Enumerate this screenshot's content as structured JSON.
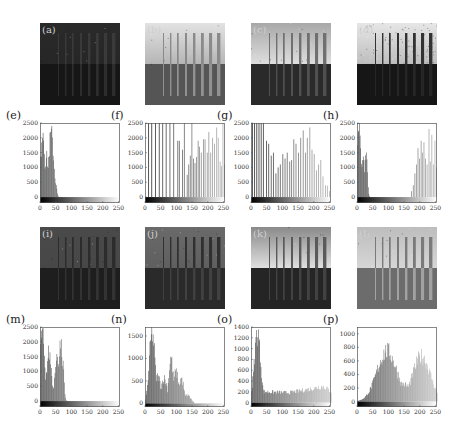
{
  "figure": {
    "images": [
      {
        "label": "(a)",
        "x": 40,
        "y": 23,
        "top": "#2a2a2a",
        "topEnd": "#262626",
        "bottom": "#161616",
        "bars": [
          "#3a3a3a",
          "#333"
        ],
        "noise": 0.02
      },
      {
        "label": "(b)",
        "x": 145,
        "y": 23,
        "top": "#e2e2e2",
        "topEnd": "#b5b5b5",
        "bottom": "#555555",
        "bars": [
          "#8a8a8a",
          "#a0a0a0"
        ],
        "noise": 0.03
      },
      {
        "label": "(c)",
        "x": 251,
        "y": 23,
        "top": "#a8a8a8",
        "topEnd": "#dedede",
        "bottom": "#2a2a2a",
        "bars": [
          "#707070",
          "#5a5a5a"
        ],
        "noise": 0.03
      },
      {
        "label": "(d)",
        "x": 357,
        "y": 23,
        "top": "#e6e6e6",
        "topEnd": "#bdbdbd",
        "bottom": "#161616",
        "bars": [
          "#333",
          "#2a2a2a"
        ],
        "noise": 0.25
      },
      {
        "label": "(i)",
        "x": 40,
        "y": 227,
        "top": "#4a4a4a",
        "topEnd": "#474747",
        "bottom": "#1e1e1e",
        "bars": [
          "#2c2c2c",
          "#383838"
        ],
        "noise": 0.03
      },
      {
        "label": "(j)",
        "x": 145,
        "y": 227,
        "top": "#6a6a6a",
        "topEnd": "#5f5f5f",
        "bottom": "#2a2a2a",
        "bars": [
          "#303030",
          "#474747"
        ],
        "noise": 0.03
      },
      {
        "label": "(k)",
        "x": 251,
        "y": 227,
        "top": "#8a8a8a",
        "topEnd": "#e0e0e0",
        "bottom": "#252525",
        "bars": [
          "#5a5a5a",
          "#4a4a4a"
        ],
        "noise": 0.03
      },
      {
        "label": "(l)",
        "x": 357,
        "y": 227,
        "top": "#bdbdbd",
        "topEnd": "#d6d6d6",
        "bottom": "#6c6c6c",
        "bars": [
          "#7a7a7a",
          "#b0b0b0"
        ],
        "noise": 0.03
      }
    ]
  },
  "chart_data": [
    {
      "panel": "(e)",
      "type": "bar",
      "title": "",
      "xlabel": "",
      "ylabel": "",
      "xlim": [
        0,
        255
      ],
      "ylim": [
        -200,
        2500
      ],
      "xticks": [
        0,
        50,
        100,
        150,
        200,
        250
      ],
      "yticks": [
        0,
        500,
        1000,
        1500,
        2000,
        2500
      ],
      "peaks": [
        {
          "x": 8,
          "h": 2500,
          "w": 6
        },
        {
          "x": 20,
          "h": 1450,
          "w": 6
        },
        {
          "x": 35,
          "h": 2300,
          "w": 8
        },
        {
          "x": 48,
          "h": 600,
          "w": 4
        }
      ],
      "cutoff": 58,
      "style": "dense",
      "color": "#3a3a3a"
    },
    {
      "panel": "(f)",
      "type": "bar",
      "title": "",
      "xlim": [
        0,
        255
      ],
      "ylim": [
        -200,
        2500
      ],
      "xticks": [
        0,
        50,
        100,
        150,
        200,
        250
      ],
      "yticks": [
        0,
        500,
        1000,
        1500,
        2000,
        2500
      ],
      "spikes": [
        [
          10,
          2500
        ],
        [
          20,
          2500
        ],
        [
          32,
          2500
        ],
        [
          44,
          2500
        ],
        [
          55,
          2500
        ],
        [
          66,
          2500
        ],
        [
          78,
          2500
        ],
        [
          90,
          2500
        ],
        [
          103,
          1900
        ],
        [
          108,
          1900
        ],
        [
          118,
          1600
        ],
        [
          124,
          2500
        ],
        [
          133,
          750
        ],
        [
          138,
          1100
        ],
        [
          143,
          1400
        ],
        [
          148,
          2500
        ],
        [
          153,
          1300
        ],
        [
          158,
          1150
        ],
        [
          163,
          1350
        ],
        [
          168,
          1900
        ],
        [
          172,
          1700
        ],
        [
          178,
          1500
        ],
        [
          185,
          1950
        ],
        [
          190,
          1950
        ],
        [
          197,
          1500
        ],
        [
          202,
          2200
        ],
        [
          208,
          1500
        ],
        [
          214,
          2000
        ],
        [
          220,
          1800
        ],
        [
          227,
          2350
        ],
        [
          232,
          2000
        ],
        [
          238,
          1200
        ],
        [
          242,
          1050
        ],
        [
          247,
          2500
        ],
        [
          252,
          1100
        ]
      ],
      "style": "sparse",
      "color": "#8a8a8a"
    },
    {
      "panel": "(g)",
      "type": "bar",
      "title": "",
      "xlim": [
        0,
        255
      ],
      "ylim": [
        -200,
        2500
      ],
      "xticks": [
        0,
        50,
        100,
        150,
        200,
        250
      ],
      "yticks": [
        0,
        500,
        1000,
        1500,
        2000,
        2500
      ],
      "spikes": [
        [
          3,
          2500
        ],
        [
          10,
          2500
        ],
        [
          17,
          2500
        ],
        [
          24,
          2500
        ],
        [
          31,
          2500
        ],
        [
          38,
          2500
        ],
        [
          48,
          1900
        ],
        [
          55,
          1800
        ],
        [
          63,
          1400
        ],
        [
          70,
          1500
        ],
        [
          78,
          800
        ],
        [
          85,
          1000
        ],
        [
          92,
          1100
        ],
        [
          100,
          1450
        ],
        [
          107,
          1300
        ],
        [
          114,
          1500
        ],
        [
          122,
          1200
        ],
        [
          128,
          1250
        ],
        [
          135,
          1950
        ],
        [
          142,
          1800
        ],
        [
          150,
          1500
        ],
        [
          157,
          2000
        ],
        [
          165,
          2250
        ],
        [
          172,
          1500
        ],
        [
          178,
          2000
        ],
        [
          186,
          2350
        ],
        [
          193,
          1600
        ],
        [
          200,
          1450
        ],
        [
          207,
          900
        ],
        [
          214,
          1100
        ],
        [
          221,
          1250
        ],
        [
          228,
          700
        ],
        [
          236,
          400
        ],
        [
          242,
          380
        ],
        [
          249,
          200
        ]
      ],
      "style": "sparse",
      "color": "#999999"
    },
    {
      "panel": "(h)",
      "type": "bar",
      "title": "",
      "xlim": [
        0,
        255
      ],
      "ylim": [
        -200,
        2500
      ],
      "xticks": [
        0,
        50,
        100,
        150,
        200,
        250
      ],
      "yticks": [
        0,
        500,
        1000,
        1500,
        2000,
        2500
      ],
      "peaks": [
        {
          "x": 5,
          "h": 2500,
          "w": 6
        },
        {
          "x": 18,
          "h": 1500,
          "w": 6
        },
        {
          "x": 28,
          "h": 1750,
          "w": 4
        }
      ],
      "cutoff": 40,
      "spikes": [
        [
          172,
          200
        ],
        [
          178,
          400
        ],
        [
          183,
          800
        ],
        [
          188,
          1100
        ],
        [
          193,
          1650
        ],
        [
          198,
          1300
        ],
        [
          203,
          1900
        ],
        [
          207,
          1500
        ],
        [
          212,
          1850
        ],
        [
          217,
          1300
        ],
        [
          222,
          1100
        ],
        [
          228,
          2300
        ],
        [
          232,
          1200
        ],
        [
          237,
          2100
        ],
        [
          242,
          1100
        ],
        [
          247,
          1900
        ],
        [
          252,
          1000
        ]
      ],
      "style": "dense",
      "color": "#333333"
    },
    {
      "panel": "(m)",
      "type": "bar",
      "title": "",
      "xlim": [
        0,
        255
      ],
      "ylim": [
        -200,
        2500
      ],
      "xticks": [
        0,
        50,
        100,
        150,
        200,
        250
      ],
      "yticks": [
        0,
        500,
        1000,
        1500,
        2000,
        2500
      ],
      "peaks": [
        {
          "x": 6,
          "h": 2500,
          "w": 7
        },
        {
          "x": 28,
          "h": 1750,
          "w": 8
        },
        {
          "x": 52,
          "h": 1700,
          "w": 6
        },
        {
          "x": 64,
          "h": 2350,
          "w": 5
        },
        {
          "x": 72,
          "h": 1300,
          "w": 4
        }
      ],
      "cutoff": 85,
      "style": "dense",
      "color": "#404040"
    },
    {
      "panel": "(n)",
      "type": "bar",
      "title": "",
      "xlim": [
        0,
        255
      ],
      "ylim": [
        -80,
        1700
      ],
      "xticks": [
        0,
        50,
        100,
        150,
        200,
        250
      ],
      "yticks": [
        0,
        500,
        1000,
        1500
      ],
      "peaks": [
        {
          "x": 22,
          "h": 1700,
          "w": 9
        },
        {
          "x": 40,
          "h": 650,
          "w": 10
        },
        {
          "x": 60,
          "h": 600,
          "w": 10
        },
        {
          "x": 82,
          "h": 1100,
          "w": 7
        },
        {
          "x": 98,
          "h": 750,
          "w": 9
        },
        {
          "x": 115,
          "h": 600,
          "w": 8
        },
        {
          "x": 135,
          "h": 200,
          "w": 10
        }
      ],
      "cutoff": 155,
      "style": "dense",
      "color": "#3c3c3c"
    },
    {
      "panel": "(o)",
      "type": "bar",
      "title": "",
      "xlim": [
        0,
        255
      ],
      "ylim": [
        -80,
        1400
      ],
      "xticks": [
        0,
        50,
        100,
        150,
        200,
        250
      ],
      "yticks": [
        0,
        200,
        400,
        600,
        800,
        1000,
        1200,
        1400
      ],
      "peaks": [
        {
          "x": 20,
          "h": 1400,
          "w": 10
        }
      ],
      "floor": [
        [
          40,
          220
        ],
        [
          120,
          200
        ],
        [
          180,
          260
        ],
        [
          230,
          330
        ],
        [
          255,
          220
        ]
      ],
      "cutoff": 255,
      "style": "dense",
      "color": "#3c3c3c"
    },
    {
      "panel": "(p)",
      "type": "bar",
      "title": "",
      "xlim": [
        0,
        255
      ],
      "ylim": [
        -80,
        1100
      ],
      "xticks": [
        0,
        50,
        100,
        150,
        200,
        250
      ],
      "yticks": [
        0,
        200,
        400,
        600,
        800,
        1000
      ],
      "peaks": [
        {
          "x": 95,
          "h": 800,
          "w": 32
        },
        {
          "x": 205,
          "h": 720,
          "w": 28
        },
        {
          "x": 145,
          "h": 280,
          "w": 30
        }
      ],
      "cutoff": 255,
      "style": "dense",
      "color": "#444444"
    }
  ],
  "histograms_layout": [
    {
      "label": "(e)",
      "x": 40,
      "y": 123
    },
    {
      "label": "(f)",
      "x": 145,
      "y": 123
    },
    {
      "label": "(g)",
      "x": 251,
      "y": 123
    },
    {
      "label": "(h)",
      "x": 357,
      "y": 123
    },
    {
      "label": "(m)",
      "x": 40,
      "y": 327
    },
    {
      "label": "(n)",
      "x": 145,
      "y": 327
    },
    {
      "label": "(o)",
      "x": 251,
      "y": 327
    },
    {
      "label": "(p)",
      "x": 357,
      "y": 327
    }
  ]
}
